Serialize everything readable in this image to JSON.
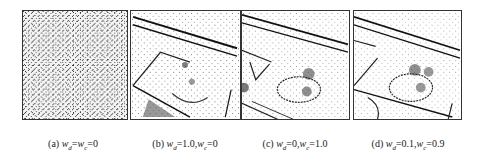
{
  "figure": {
    "panels": [
      {
        "id": "a",
        "label": "(a)",
        "wd": "0",
        "wc": "0",
        "caption_suffix": "w_d=w_c=0",
        "description": "uniform random noise texture, no structure"
      },
      {
        "id": "b",
        "label": "(b)",
        "wd": "1.0",
        "wc": "0",
        "description": "noisy edge map of scene with road lines, rectangle and curved object"
      },
      {
        "id": "c",
        "label": "(c)",
        "wd": "0",
        "wc": "1.0",
        "description": "edge map with clearer lines and oval shape with blob clusters"
      },
      {
        "id": "d",
        "label": "(d)",
        "wd": "0.1",
        "wc": "0.9",
        "description": "cleanest edge map with lines, oval and clustered blobs"
      }
    ],
    "captions": [
      "(a) w_d=w_c=0",
      "(b) w_d=1.0,w_c=0",
      "(c) w_d=0,w_c=1.0",
      "(d) w_d=0.1,w_c=0.9"
    ]
  }
}
